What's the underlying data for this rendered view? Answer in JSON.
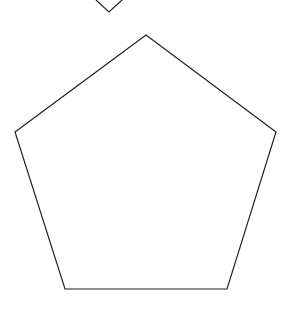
{
  "canvas": {
    "width": 286,
    "height": 309,
    "background": "#ffffff"
  },
  "shapes": [
    {
      "type": "diamond-partial",
      "points": "96,0 109,12 122,0",
      "stroke": "#222222"
    },
    {
      "type": "pentagon",
      "points": "146,35 276,132 227,289 65,289 15,132",
      "stroke": "#222222"
    }
  ]
}
